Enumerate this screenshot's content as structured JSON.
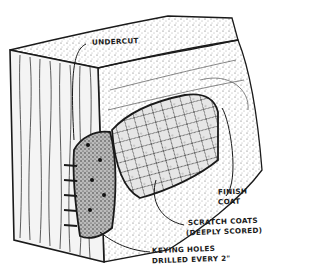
{
  "figure": {
    "colors": {
      "ink": "#1a1a1a",
      "paper": "#ffffff",
      "stipple": "#555555"
    }
  },
  "labels": {
    "undercut": "UNDERCUT",
    "finish_coat_line1": "FINISH",
    "finish_coat_line2": "COAT",
    "scratch_coats_line1": "SCRATCH COATS",
    "scratch_coats_line2": "(DEEPLY SCORED)",
    "keying_holes_line1": "KEYING HOLES",
    "keying_holes_line2": "DRILLED EVERY 2\""
  }
}
